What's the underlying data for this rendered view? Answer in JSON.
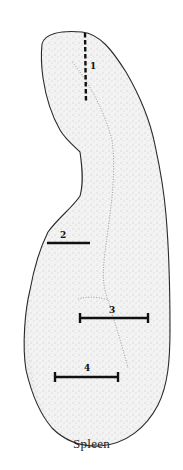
{
  "figure": {
    "caption": "Spleen",
    "style": "stippled anatomical illustration",
    "colors": {
      "outline": "#2a2a2a",
      "stipple": "#9a9a9a",
      "marker": "#111111",
      "background": "#ffffff"
    },
    "markers": [
      {
        "id": 1,
        "label": "1",
        "type": "dashed",
        "orientation": "vertical"
      },
      {
        "id": 2,
        "label": "2",
        "type": "solid",
        "orientation": "horizontal"
      },
      {
        "id": 3,
        "label": "3",
        "type": "solid-capped",
        "orientation": "horizontal"
      },
      {
        "id": 4,
        "label": "4",
        "type": "solid-capped",
        "orientation": "horizontal"
      }
    ]
  }
}
